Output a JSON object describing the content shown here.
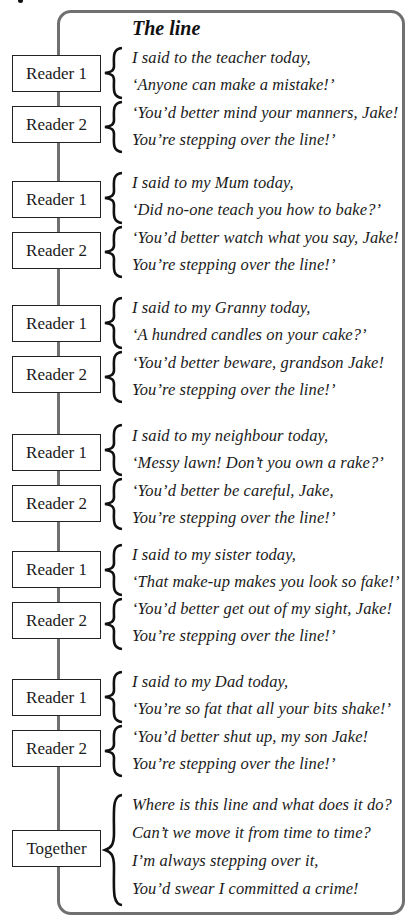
{
  "poem": {
    "title": "The line",
    "stanzas": [
      {
        "parts": [
          {
            "speaker": "Reader 1",
            "lines": [
              "I said to the teacher today,",
              "‘Anyone can make a mistake!’"
            ]
          },
          {
            "speaker": "Reader 2",
            "lines": [
              "‘You’d better mind your manners, Jake!",
              "You’re stepping over the line!’"
            ]
          }
        ]
      },
      {
        "parts": [
          {
            "speaker": "Reader 1",
            "lines": [
              "I said to my Mum today,",
              "‘Did no-one teach you how to bake?’"
            ]
          },
          {
            "speaker": "Reader 2",
            "lines": [
              "‘You’d better watch what you say, Jake!",
              "You’re stepping over the line!’"
            ]
          }
        ]
      },
      {
        "parts": [
          {
            "speaker": "Reader 1",
            "lines": [
              "I said to my Granny today,",
              "‘A hundred candles on your cake?’"
            ]
          },
          {
            "speaker": "Reader 2",
            "lines": [
              "‘You’d better beware, grandson Jake!",
              "You’re stepping over the line!’"
            ]
          }
        ]
      },
      {
        "parts": [
          {
            "speaker": "Reader 1",
            "lines": [
              "I said to my neighbour today,",
              "‘Messy lawn! Don’t you own a rake?’"
            ]
          },
          {
            "speaker": "Reader 2",
            "lines": [
              "‘You’d better be careful, Jake,",
              "You’re stepping over the line!’"
            ]
          }
        ]
      },
      {
        "parts": [
          {
            "speaker": "Reader 1",
            "lines": [
              "I said to my sister today,",
              "‘That make-up makes you look so fake!’"
            ]
          },
          {
            "speaker": "Reader 2",
            "lines": [
              "‘You’d better get out of my sight, Jake!",
              "You’re stepping over the line!’"
            ]
          }
        ]
      },
      {
        "parts": [
          {
            "speaker": "Reader 1",
            "lines": [
              "I said to my Dad today,",
              "‘You’re so fat that all your bits shake!’"
            ]
          },
          {
            "speaker": "Reader 2",
            "lines": [
              "‘You’d better shut up, my son Jake!",
              "You’re stepping over the line!’"
            ]
          }
        ]
      },
      {
        "parts": [
          {
            "speaker": "Together",
            "lines": [
              "Where is this line and what does it do?",
              "Can’t we move it from time to time?",
              "I’m always stepping over it,",
              "You’d swear I committed a crime!"
            ]
          }
        ]
      }
    ]
  },
  "colors": {
    "frame": "#707070",
    "text": "#1a1a1a",
    "background": "#ffffff"
  }
}
